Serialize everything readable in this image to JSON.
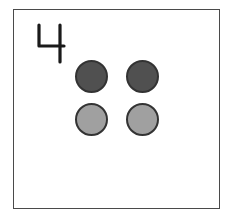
{
  "card": {
    "number_label": "4",
    "dot_count": 4,
    "dots": [
      {
        "row": 1,
        "col": 1,
        "shade": "dark",
        "color": "#505050"
      },
      {
        "row": 1,
        "col": 2,
        "shade": "dark",
        "color": "#505050"
      },
      {
        "row": 2,
        "col": 1,
        "shade": "light",
        "color": "#a0a0a0"
      },
      {
        "row": 2,
        "col": 2,
        "shade": "light",
        "color": "#a0a0a0"
      }
    ]
  },
  "colors": {
    "border": "#4a4a4a",
    "numeral": "#1a1a1a",
    "dot_outline": "#333333"
  }
}
